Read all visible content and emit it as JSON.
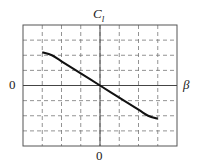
{
  "chart_data": {
    "type": "line",
    "title": "",
    "xlabel": "β",
    "ylabel": "C_l",
    "x_tick_labels": [
      "0"
    ],
    "y_tick_labels": [
      "0"
    ],
    "grid": true,
    "grid_style": "dashed",
    "grid_divisions": {
      "x": 8,
      "y": 8
    },
    "xlim": [
      -4,
      4
    ],
    "ylim": [
      -4,
      4
    ],
    "series": [
      {
        "name": "C_l vs β",
        "x": [
          -3.0,
          -2.5,
          -2.0,
          -1.0,
          0.0,
          1.0,
          2.0,
          2.5,
          3.0
        ],
        "y": [
          2.2,
          2.0,
          1.6,
          0.8,
          0.0,
          -0.8,
          -1.6,
          -2.0,
          -2.2
        ]
      }
    ]
  },
  "labels": {
    "y_axis": "C",
    "y_axis_sub": "l",
    "x_axis": "β",
    "y_zero": "0",
    "x_zero": "0"
  }
}
